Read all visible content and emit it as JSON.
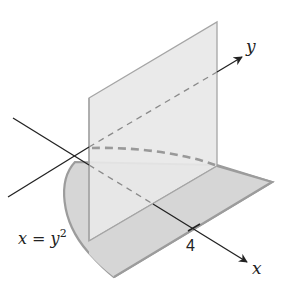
{
  "diagram": {
    "type": "3d-region",
    "axes": {
      "x_label": "x",
      "y_label": "y"
    },
    "tick": {
      "x_value": "4"
    },
    "curve_label": {
      "lhs": "x = y",
      "exponent": "2"
    },
    "colors": {
      "plane_fill": "#e6e6e6",
      "region_fill": "#d4d4d4",
      "edge": "#999999",
      "axis": "#222222",
      "dashed": "#8a8a8a"
    }
  }
}
